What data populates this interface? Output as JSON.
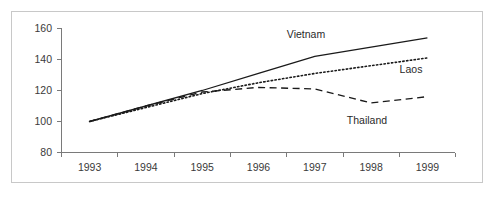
{
  "chart_data": {
    "type": "line",
    "title": "",
    "subtitle": "",
    "xlabel": "",
    "ylabel": "",
    "categories": [
      "1993",
      "1994",
      "1995",
      "1996",
      "1997",
      "1998",
      "1999"
    ],
    "ylim": [
      80,
      160
    ],
    "yticks": [
      80,
      100,
      120,
      140,
      160
    ],
    "xtick_labels": [
      "1993",
      "1994",
      "1995",
      "1996",
      "1997",
      "1998",
      "1999"
    ],
    "grid": false,
    "legend_position": "inline-labels",
    "series": [
      {
        "name": "Vietnam",
        "style": "solid",
        "color": "#1a1a1a",
        "values": [
          100,
          110,
          120,
          131,
          142,
          148,
          154
        ],
        "label_text": "Vietnam"
      },
      {
        "name": "Laos",
        "style": "dotted",
        "color": "#1a1a1a",
        "values": [
          100,
          109,
          118,
          125,
          131,
          136,
          141
        ],
        "label_text": "Laos"
      },
      {
        "name": "Thailand",
        "style": "dashed",
        "color": "#1a1a1a",
        "values": [
          100,
          110,
          119,
          122,
          121,
          112,
          116
        ],
        "label_text": "Thailand"
      }
    ],
    "annotations": [
      {
        "text": "Vietnam",
        "x_px": 306,
        "y_px": 38
      },
      {
        "text": "Laos",
        "x_px": 411,
        "y_px": 73
      },
      {
        "text": "Thailand",
        "x_px": 367,
        "y_px": 124
      }
    ]
  },
  "axis": {
    "y_labels": [
      "160",
      "140",
      "120",
      "100",
      "80"
    ],
    "x_labels": [
      "1993",
      "1994",
      "1995",
      "1996",
      "1997",
      "1998",
      "1999"
    ]
  },
  "colors": {
    "frame_border": "#c8c8c8",
    "axis": "#7a7a7a",
    "ink": "#1a1a1a",
    "text": "#3a3a3a",
    "background": "#ffffff"
  }
}
